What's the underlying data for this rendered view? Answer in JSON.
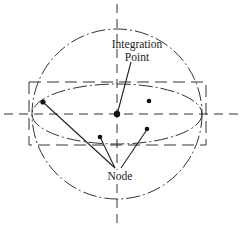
{
  "diagram": {
    "type": "integration-point-element-schematic",
    "labels": {
      "integration_point_line1": "Integration",
      "integration_point_line2": "Point",
      "node": "Node"
    },
    "colors": {
      "stroke": "#333333",
      "background": "#ffffff"
    },
    "axes": {
      "vertical_x": 117,
      "horizontal_y": 114
    },
    "shapes": {
      "sphere": {
        "cx": 117,
        "cy": 114,
        "r": 85,
        "style": "dash-dot"
      },
      "ellipse": {
        "cx": 117,
        "cy": 114,
        "rx": 85,
        "ry": 30,
        "style": "dash-dot"
      },
      "bounding_box": {
        "x": 29,
        "y": 82,
        "width": 177,
        "height": 63,
        "style": "dashed"
      }
    },
    "integration_point": {
      "x": 117,
      "y": 114
    },
    "nodes": [
      {
        "x": 43,
        "y": 102
      },
      {
        "x": 149,
        "y": 101
      },
      {
        "x": 100,
        "y": 137
      },
      {
        "x": 147,
        "y": 129
      }
    ],
    "leaders": {
      "integration_point": {
        "from": [
          131,
          62
        ],
        "to": [
          117,
          112
        ]
      },
      "node_targets": [
        {
          "from": [
            116,
            168
          ],
          "to": [
            45,
            104
          ]
        },
        {
          "from": [
            116,
            168
          ],
          "to": [
            101,
            139
          ]
        },
        {
          "from": [
            120,
            168
          ],
          "to": [
            146,
            131
          ]
        }
      ]
    }
  }
}
